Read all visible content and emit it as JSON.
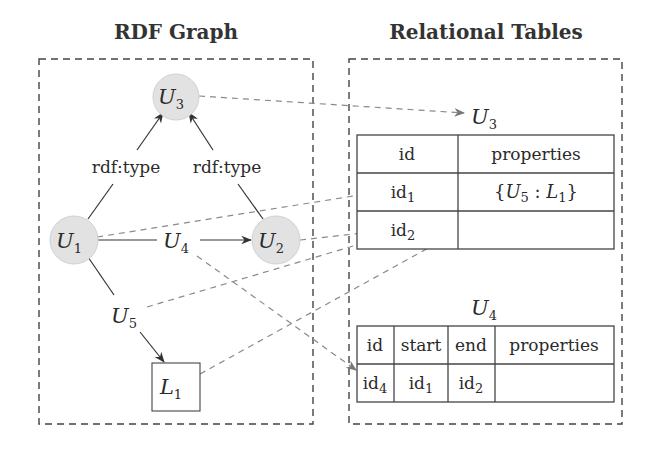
{
  "titles": {
    "left": "RDF Graph",
    "right": "Relational Tables"
  },
  "graph": {
    "nodes": [
      {
        "id": "U3",
        "base": "U",
        "sub": "3",
        "kind": "resource"
      },
      {
        "id": "U1",
        "base": "U",
        "sub": "1",
        "kind": "resource"
      },
      {
        "id": "U2",
        "base": "U",
        "sub": "2",
        "kind": "resource"
      },
      {
        "id": "L1",
        "base": "L",
        "sub": "1",
        "kind": "literal"
      }
    ],
    "edges": [
      {
        "from": "U1",
        "to": "U3",
        "label": "rdf:type"
      },
      {
        "from": "U2",
        "to": "U3",
        "label": "rdf:type"
      },
      {
        "from": "U1",
        "to": "U2",
        "label_base": "U",
        "label_sub": "4"
      },
      {
        "from": "U1",
        "to": "L1",
        "label_base": "U",
        "label_sub": "5"
      }
    ]
  },
  "tables": {
    "u3": {
      "name_base": "U",
      "name_sub": "3",
      "columns": [
        "id",
        "properties"
      ],
      "rows": [
        {
          "id_base": "id",
          "id_sub": "1",
          "properties": "{U5 : L1}"
        },
        {
          "id_base": "id",
          "id_sub": "2",
          "properties": ""
        }
      ]
    },
    "u4": {
      "name_base": "U",
      "name_sub": "4",
      "columns": [
        "id",
        "start",
        "end",
        "properties"
      ],
      "rows": [
        {
          "id_base": "id",
          "id_sub": "4",
          "start_base": "id",
          "start_sub": "1",
          "end_base": "id",
          "end_sub": "2",
          "properties": ""
        }
      ]
    }
  },
  "mappings": [
    {
      "from": "node U3",
      "to": "table U3 title"
    },
    {
      "from": "node U1",
      "to": "table U3 row id1"
    },
    {
      "from": "node U2",
      "to": "table U3 row id2"
    },
    {
      "from": "edge label U5",
      "to": "table U3 row id1 properties"
    },
    {
      "from": "literal L1",
      "to": "table U3 row id1 properties"
    },
    {
      "from": "edge label U4",
      "to": "table U4 row id4"
    }
  ],
  "colors": {
    "node_fill": "#e2e2e2",
    "mapping_line": "#8a8a8a",
    "ink": "#2a2a2a"
  }
}
